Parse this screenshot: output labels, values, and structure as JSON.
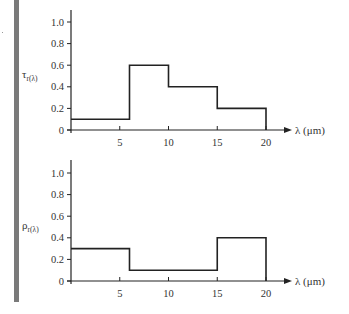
{
  "figure": {
    "decorations": {
      "side_bar_color": "#7a7a7a",
      "line_color": "#222222"
    }
  },
  "chart_data": [
    {
      "type": "line",
      "step": true,
      "title": "",
      "ylabel": "τ_r(λ)",
      "ylabel_main": "τ",
      "ylabel_sub": "r(λ)",
      "xlabel": "λ (μm)",
      "xlim": [
        0,
        20
      ],
      "ylim": [
        0,
        1.0
      ],
      "xticks": [
        5,
        10,
        15,
        20
      ],
      "xtick_labels": [
        "5",
        "10",
        "15",
        "20"
      ],
      "yticks": [
        0,
        0.2,
        0.4,
        0.6,
        0.8,
        1.0
      ],
      "ytick_labels": [
        "0",
        "0.2",
        "0.4",
        "0.6",
        "0.8",
        "1.0"
      ],
      "grid": false,
      "legend": null,
      "segments": [
        {
          "x_start": 0,
          "x_end": 6,
          "value": 0.1
        },
        {
          "x_start": 6,
          "x_end": 10,
          "value": 0.6
        },
        {
          "x_start": 10,
          "x_end": 15,
          "value": 0.4
        },
        {
          "x_start": 15,
          "x_end": 20,
          "value": 0.2
        }
      ]
    },
    {
      "type": "line",
      "step": true,
      "title": "",
      "ylabel": "ρ_r(λ)",
      "ylabel_main": "ρ",
      "ylabel_sub": "r(λ)",
      "xlabel": "λ (μm)",
      "xlim": [
        0,
        20
      ],
      "ylim": [
        0,
        1.0
      ],
      "xticks": [
        5,
        10,
        15,
        20
      ],
      "xtick_labels": [
        "5",
        "10",
        "15",
        "20"
      ],
      "yticks": [
        0,
        0.2,
        0.4,
        0.6,
        0.8,
        1.0
      ],
      "ytick_labels": [
        "0",
        "0.2",
        "0.4",
        "0.6",
        "0.8",
        "1.0"
      ],
      "grid": false,
      "legend": null,
      "segments": [
        {
          "x_start": 0,
          "x_end": 6,
          "value": 0.3
        },
        {
          "x_start": 6,
          "x_end": 15,
          "value": 0.1
        },
        {
          "x_start": 15,
          "x_end": 20,
          "value": 0.4
        }
      ]
    }
  ]
}
